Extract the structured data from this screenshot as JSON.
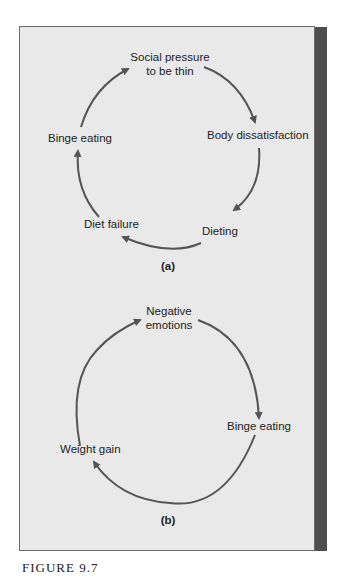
{
  "figure": {
    "caption": "FIGURE 9.7",
    "colors": {
      "panel": "#e9e9e9",
      "arrow": "#555555",
      "strip": "#4e4e4e",
      "text": "#222222"
    }
  },
  "diagram_a": {
    "tag": "(a)",
    "nodes": [
      {
        "id": "social",
        "line1": "Social pressure",
        "line2": "to be thin"
      },
      {
        "id": "body",
        "label": "Body dissatisfaction"
      },
      {
        "id": "dieting",
        "label": "Dieting"
      },
      {
        "id": "failure",
        "label": "Diet failure"
      },
      {
        "id": "binge",
        "label": "Binge eating"
      }
    ],
    "edges": [
      [
        "social",
        "body"
      ],
      [
        "body",
        "dieting"
      ],
      [
        "dieting",
        "failure"
      ],
      [
        "failure",
        "binge"
      ],
      [
        "binge",
        "social"
      ]
    ]
  },
  "diagram_b": {
    "tag": "(b)",
    "nodes": [
      {
        "id": "negative",
        "line1": "Negative",
        "line2": "emotions"
      },
      {
        "id": "binge",
        "label": "Binge eating"
      },
      {
        "id": "weight",
        "label": "Weight gain"
      }
    ],
    "edges": [
      [
        "negative",
        "binge"
      ],
      [
        "binge",
        "weight"
      ],
      [
        "weight",
        "negative"
      ]
    ]
  }
}
